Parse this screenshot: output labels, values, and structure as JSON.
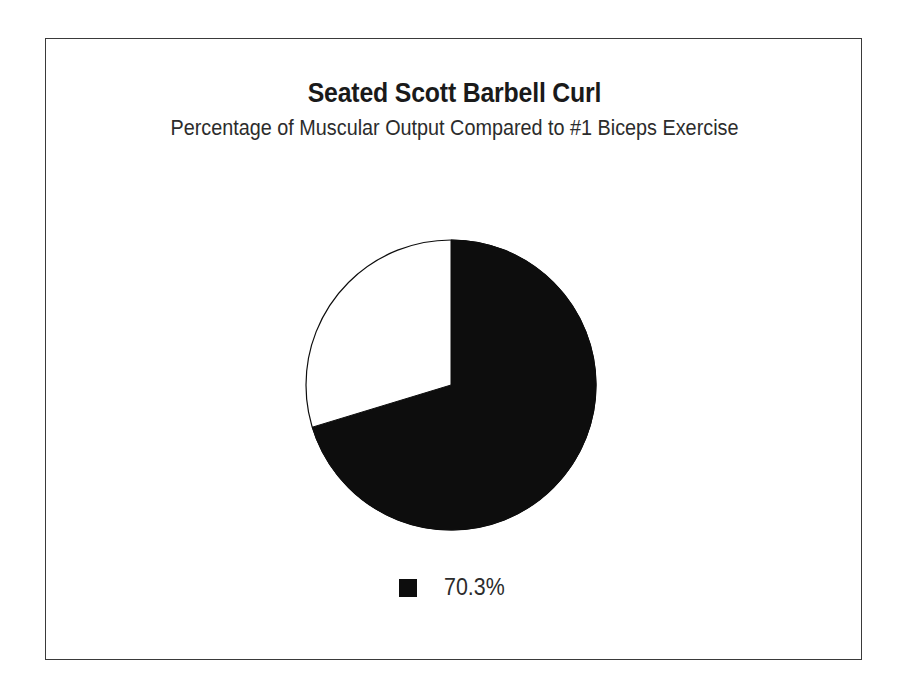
{
  "figure": {
    "title": "Seated Scott Barbell Curl",
    "subtitle": "Percentage of Muscular Output Compared to #1 Biceps Exercise",
    "border_color": "#3a3a3a",
    "background_color": "#ffffff"
  },
  "legend": {
    "position": "bottom-center",
    "entries": [
      {
        "label": "70.3%",
        "color": "#0d0d0d",
        "marker": "square-swatch"
      }
    ]
  },
  "chart_data": {
    "type": "pie",
    "title": "Seated Scott Barbell Curl",
    "subtitle": "Percentage of Muscular Output Compared to #1 Biceps Exercise",
    "xlabel": "",
    "ylabel": "",
    "grid": false,
    "legend_position": "bottom-center",
    "start_angle_deg": 90,
    "direction": "clockwise",
    "labels": [
      "70.3%",
      ""
    ],
    "values": [
      70.3,
      29.7
    ],
    "display_values": [
      "70.3%",
      ""
    ],
    "slice_angles_deg": [
      253.1,
      106.9
    ],
    "colors": [
      "#0d0d0d",
      "#ffffff"
    ],
    "edge_color": "#0d0d0d",
    "slices": [
      {
        "label": "70.3%",
        "value": 70.3,
        "display": "70.3%",
        "color": "#0d0d0d",
        "angle_deg": 253.1,
        "in_legend": true
      },
      {
        "label": "",
        "value": 29.7,
        "display": "",
        "color": "#ffffff",
        "angle_deg": 106.9,
        "in_legend": false
      }
    ]
  }
}
